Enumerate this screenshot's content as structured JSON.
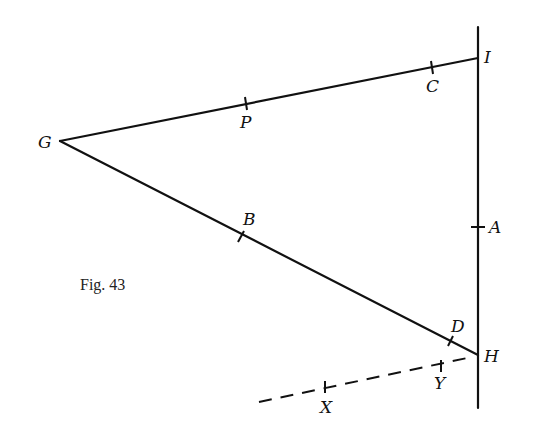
{
  "figure": {
    "caption": "Fig. 43",
    "labels": {
      "G": "G",
      "P": "P",
      "C": "C",
      "I": "I",
      "B": "B",
      "A": "A",
      "D": "D",
      "H": "H",
      "Y": "Y",
      "X": "X"
    },
    "points": {
      "G": [
        60,
        141
      ],
      "I": [
        478,
        58
      ],
      "H": [
        478,
        355
      ],
      "P": [
        246,
        104
      ],
      "C": [
        432,
        67
      ],
      "B": [
        241,
        237
      ],
      "A": [
        478,
        227
      ],
      "D": [
        451,
        341
      ],
      "Y": [
        439,
        366
      ],
      "X": [
        326,
        386
      ]
    },
    "segments": [
      {
        "from": "G",
        "to": "I",
        "style": "solid"
      },
      {
        "from": "G",
        "to": "H",
        "style": "solid"
      },
      {
        "from": "vertical-top",
        "to": "vertical-bottom",
        "style": "solid"
      },
      {
        "from": "dashed-start",
        "to": "H",
        "style": "dashed"
      }
    ],
    "color": "#111111"
  }
}
